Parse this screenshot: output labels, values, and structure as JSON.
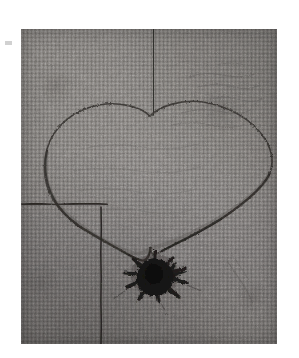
{
  "artwork": {
    "domain": "Natural-Image",
    "medium_description": "Grayscale photograph of a drawing on coarse woven canvas",
    "subject": "heart outline with radiating dark star blot at its lower point",
    "page_background_color": "#ffffff",
    "canvas": {
      "label": "canvas-plate",
      "x": 21,
      "y": 29,
      "width": 256,
      "height": 315,
      "base_color": "#7a7774",
      "dark_tone": "#6a6765",
      "light_tone": "#8a8784",
      "texture": "woven-linen"
    },
    "marks": {
      "ink_color": "#2b2826",
      "faint_ink_color": "#4a4745",
      "heart": {
        "label": "heart-outline",
        "stroke_color": "#3a3734",
        "cleft_x": 150,
        "point_x": 150,
        "point_y": 247,
        "left_extent_x": 42,
        "right_extent_x": 272,
        "top_y": 104
      },
      "top_line": {
        "label": "vertical-line-top",
        "x": 153,
        "y_start": 29,
        "y_end": 110,
        "stroke_color": "#33302e"
      },
      "left_horizontal_line": {
        "label": "horizontal-line-left",
        "y": 203,
        "x_start": 21,
        "x_end": 108,
        "stroke_color": "#2f2c2a"
      },
      "lower_vertical_line": {
        "label": "vertical-line-lower",
        "x": 101,
        "y_start": 206,
        "y_end": 344,
        "stroke_color": "#2e2b29"
      },
      "star_blot": {
        "label": "star-burst-blot",
        "center_x": 155,
        "center_y": 275,
        "radius": 14,
        "spike_count": 9,
        "fill_color": "#1b1918",
        "spike_color": "#22201e"
      },
      "margin_mark": {
        "label": "stray-margin-mark",
        "x": 5,
        "y": 41,
        "width": 7,
        "height": 4,
        "color": "#c9c9c9"
      }
    }
  }
}
